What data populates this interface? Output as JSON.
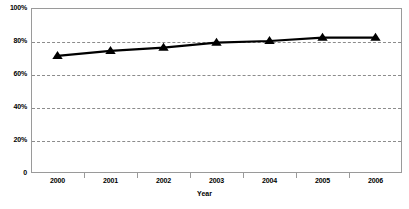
{
  "chart_data": {
    "type": "line",
    "title": "",
    "xlabel": "Year",
    "ylabel": "",
    "categories": [
      "2000",
      "2001",
      "2002",
      "2003",
      "2004",
      "2005",
      "2006"
    ],
    "values": [
      71,
      74,
      76,
      79,
      80,
      82,
      82
    ],
    "series": [
      {
        "name": "",
        "values": [
          71,
          74,
          76,
          79,
          80,
          82,
          82
        ]
      }
    ],
    "ylim": [
      0,
      100
    ],
    "ytick_labels": [
      "0",
      "20%",
      "40%",
      "60%",
      "80%",
      "100%"
    ],
    "ytick_values": [
      0,
      20,
      40,
      60,
      80,
      100
    ],
    "grid": true,
    "grid_style": "dashed-horizontal",
    "legend": "none",
    "marker": "triangle",
    "marker_color": "#000000",
    "line_color": "#000000"
  }
}
